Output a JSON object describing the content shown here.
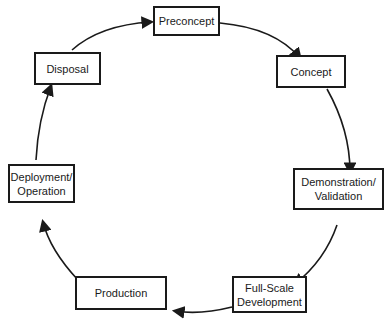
{
  "diagram": {
    "type": "cycle",
    "stages": [
      {
        "id": "preconcept",
        "lines": [
          "Preconcept"
        ]
      },
      {
        "id": "concept",
        "lines": [
          "Concept"
        ]
      },
      {
        "id": "demonstration",
        "lines": [
          "Demonstration/",
          "Validation"
        ]
      },
      {
        "id": "fullscale",
        "lines": [
          "Full-Scale",
          "Development"
        ]
      },
      {
        "id": "production",
        "lines": [
          "Production"
        ]
      },
      {
        "id": "deployment",
        "lines": [
          "Deployment/",
          "Operation"
        ]
      },
      {
        "id": "disposal",
        "lines": [
          "Disposal"
        ]
      }
    ],
    "flow": "clockwise",
    "colors": {
      "line": "#1a1a1a",
      "background": "#ffffff"
    }
  }
}
